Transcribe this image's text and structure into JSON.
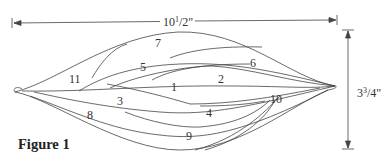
{
  "caption": "Figure 1",
  "dimensions": {
    "width": {
      "whole": "10",
      "num": "1",
      "den": "2",
      "unit": "\""
    },
    "height": {
      "whole": "3",
      "num": "3",
      "den": "4",
      "unit": "\""
    }
  },
  "pieces": [
    {
      "label": "1",
      "x": 173,
      "y": 86
    },
    {
      "label": "2",
      "x": 220,
      "y": 74
    },
    {
      "label": "3",
      "x": 117,
      "y": 95
    },
    {
      "label": "4",
      "x": 207,
      "y": 108
    },
    {
      "label": "5",
      "x": 140,
      "y": 62
    },
    {
      "label": "6",
      "x": 251,
      "y": 58
    },
    {
      "label": "7",
      "x": 156,
      "y": 38
    },
    {
      "label": "8",
      "x": 88,
      "y": 110
    },
    {
      "label": "9",
      "x": 188,
      "y": 132
    },
    {
      "label": "10",
      "x": 270,
      "y": 94
    },
    {
      "label": "11",
      "x": 70,
      "y": 75
    }
  ],
  "colors": {
    "line": "#444444",
    "text": "#333333"
  }
}
